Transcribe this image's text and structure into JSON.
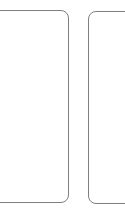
{
  "screen": {
    "width": 125,
    "height": 223,
    "background_color": "#ffffff",
    "description": "Cropped fragment showing two empty rounded rectangular card panels side by side"
  },
  "theme": {
    "panel_background_color": "#ffffff",
    "panel_border_color": "#7f7f7f",
    "panel_border_width_px": 1,
    "panel_corner_radius_px": 8
  },
  "panels": [
    {
      "id": "panel-left",
      "name": "left-card",
      "label": "",
      "content": "",
      "clipped_edge": "left",
      "geometry": {
        "x": -14,
        "y": 10,
        "width": 83,
        "height": 193
      }
    },
    {
      "id": "panel-right",
      "name": "right-card",
      "label": "",
      "content": "",
      "clipped_edge": "right",
      "geometry": {
        "x": 88,
        "y": 11,
        "width": 52,
        "height": 193
      }
    }
  ]
}
